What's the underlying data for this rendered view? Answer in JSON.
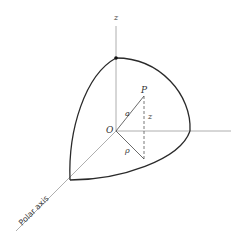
{
  "diagram": {
    "type": "3d-coordinate-sketch",
    "labels": {
      "z_axis": "z",
      "origin": "O",
      "point": "P",
      "radius": "a",
      "height": "z",
      "rho": "ρ",
      "polar_axis": "Polar axis"
    },
    "colors": {
      "background": "#ffffff",
      "axis": "#9a9a9a",
      "arc": "#2a2a2a",
      "text": "#333333"
    }
  }
}
